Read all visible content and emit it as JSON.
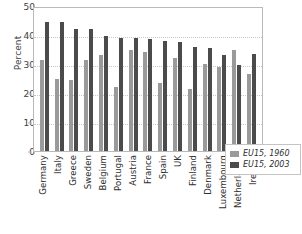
{
  "chart_data": {
    "type": "bar",
    "title": "",
    "xlabel": "",
    "ylabel": "Percent",
    "ylim": [
      0,
      50
    ],
    "yticks": [
      0,
      10,
      20,
      30,
      40,
      50
    ],
    "grid": true,
    "legend_position": "bottom-right",
    "categories": [
      "Germany",
      "Italy",
      "Greece",
      "Sweden",
      "Belgium",
      "Portugal",
      "Austria",
      "France",
      "Spain",
      "UK",
      "Finland",
      "Denmark",
      "Luxembourg",
      "Netherlands",
      "Ireland"
    ],
    "series": [
      {
        "name": "EU15, 1960",
        "color": "#9a9a9a",
        "values": [
          31.5,
          25.0,
          24.5,
          31.5,
          33.0,
          22.0,
          35.0,
          34.0,
          23.5,
          32.0,
          21.5,
          30.0,
          29.0,
          34.7,
          26.7
        ]
      },
      {
        "name": "EU15, 2003",
        "color": "#4b4b4b",
        "values": [
          44.5,
          44.5,
          42.0,
          42.0,
          39.7,
          38.8,
          38.8,
          38.5,
          38.0,
          37.5,
          36.0,
          35.5,
          33.0,
          29.8,
          33.3
        ]
      }
    ]
  },
  "axis": {
    "y_title": "Percent",
    "y_tick_labels": [
      "50",
      "40",
      "30",
      "20",
      "10",
      "0"
    ]
  },
  "legend": {
    "entries": [
      {
        "label": "EU15, 1960",
        "color": "#9a9a9a"
      },
      {
        "label": "EU15, 2003",
        "color": "#4b4b4b"
      }
    ]
  }
}
